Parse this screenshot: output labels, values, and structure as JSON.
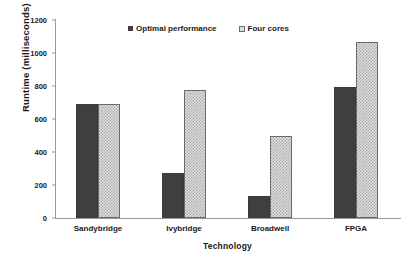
{
  "chart_data": {
    "type": "bar",
    "title": "",
    "xlabel": "Technology",
    "ylabel": "Runtime (milliseconds)",
    "categories": [
      "Sandybridge",
      "Ivybridge",
      "Broadwell",
      "FPGA"
    ],
    "series": [
      {
        "name": "Optimal performance",
        "values": [
          690,
          275,
          135,
          795
        ],
        "color": "#3f3f3f",
        "pattern": "solid"
      },
      {
        "name": "Four cores",
        "values": [
          690,
          775,
          497,
          1065
        ],
        "color": "#dedede",
        "pattern": "checkered"
      }
    ],
    "ylim": [
      0,
      1200
    ],
    "yticks": [
      0,
      200,
      400,
      600,
      800,
      1000,
      1200
    ],
    "ytick_labels": [
      "0",
      "200",
      "400",
      "600",
      "800",
      "1000",
      "1200"
    ],
    "grid": false,
    "legend_position": "top-center",
    "background": "#ffffff",
    "axis_color": "#9a9a9a"
  }
}
